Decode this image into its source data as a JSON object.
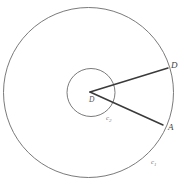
{
  "figure": {
    "kind": "geometry-diagram",
    "background_color": "#ffffff",
    "stroke_color_circles": "#6b6b6b",
    "stroke_color_lines": "#3a3a3a",
    "label_color": "#4a4a4a"
  },
  "shapes": {
    "outer_circle": {
      "name": "c1",
      "center_x": 88.5,
      "center_y": 92.5,
      "radius": 85
    },
    "inner_circle": {
      "name": "c2",
      "center_x": 91,
      "center_y": 92.5,
      "radius": 24
    },
    "center_point": {
      "x": 90,
      "y": 92
    },
    "segment_upper": {
      "x1": 90,
      "y1": 92,
      "x2": 168,
      "y2": 68
    },
    "segment_lower": {
      "x1": 90,
      "y1": 92,
      "x2": 163,
      "y2": 125
    }
  },
  "labels": {
    "outer_point_upper": "D",
    "outer_point_lower": "A",
    "center_point": "D",
    "inner_circle_name": "c",
    "inner_circle_subscript": "2",
    "outer_circle_name": "c",
    "outer_circle_subscript": "1"
  }
}
